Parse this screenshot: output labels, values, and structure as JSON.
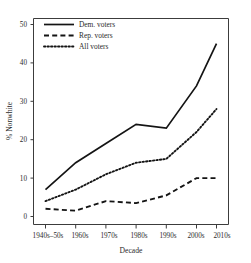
{
  "chart_data": {
    "type": "line",
    "title": "",
    "xlabel": "Decade",
    "ylabel": "% Nonwhite",
    "categories": [
      "1940s–50s",
      "1960s",
      "1970s",
      "1980s",
      "1990s",
      "2000s",
      "2010s"
    ],
    "xtick_labels": [
      "1940s–50s",
      "1960s",
      "1970s",
      "1980s",
      "1990s",
      "2000s",
      "2010s"
    ],
    "ytick_labels": [
      "0",
      "10",
      "20",
      "30",
      "40",
      "50"
    ],
    "ytick_values": [
      0,
      10,
      20,
      30,
      40,
      50
    ],
    "ylim": [
      0,
      52
    ],
    "grid": false,
    "legend_position": "top-left",
    "series": [
      {
        "name": "Dem. voters",
        "style": "solid",
        "color": "#141414",
        "values": [
          7,
          14,
          19,
          24,
          23,
          34,
          45
        ]
      },
      {
        "name": "Rep. voters",
        "style": "dashed",
        "color": "#141414",
        "values": [
          2,
          1.5,
          4,
          3.5,
          5.5,
          10,
          10
        ]
      },
      {
        "name": "All voters",
        "style": "dotted",
        "color": "#141414",
        "values": [
          4,
          7,
          11,
          14,
          15,
          22,
          28
        ]
      }
    ]
  },
  "legend": {
    "items": [
      {
        "label": "Dem. voters",
        "style": "solid"
      },
      {
        "label": "Rep. voters",
        "style": "dashed"
      },
      {
        "label": "All voters",
        "style": "dotted"
      }
    ]
  },
  "axes": {
    "y_title": "% Nonwhite",
    "x_title": "Decade"
  }
}
